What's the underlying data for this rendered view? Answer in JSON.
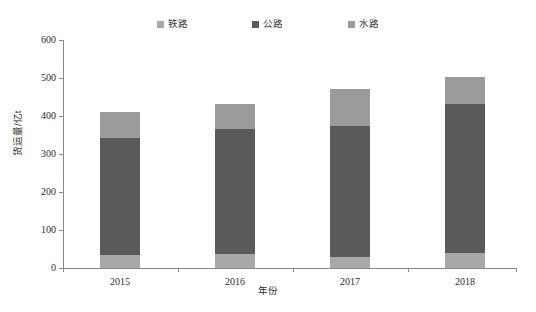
{
  "chart_data": {
    "type": "bar",
    "subtype": "stacked-vertical",
    "title": "",
    "xlabel": "年份",
    "ylabel": "货运量/亿t",
    "categories": [
      "2015",
      "2016",
      "2017",
      "2018"
    ],
    "series": [
      {
        "name": "铁路",
        "color": "#a8a8a8",
        "values": [
          33,
          37,
          29,
          39
        ]
      },
      {
        "name": "公路",
        "color": "#5a5a5a",
        "values": [
          310,
          330,
          345,
          392
        ]
      },
      {
        "name": "水路",
        "color": "#9b9b9b",
        "values": [
          67,
          65,
          97,
          72
        ]
      }
    ],
    "totals": [
      410,
      432,
      471,
      503
    ],
    "ylim": [
      0,
      600
    ],
    "yticks": [
      0,
      100,
      200,
      300,
      400,
      500,
      600
    ],
    "ytick_labels": [
      "0",
      "100",
      "200",
      "300",
      "400",
      "500",
      "600"
    ],
    "grid": false,
    "legend_position": "top-center",
    "stack_order_bottom_to_top": [
      "铁路",
      "公路",
      "水路"
    ]
  },
  "legend": {
    "items": [
      {
        "label": "铁路",
        "icon": "square-swatch-icon",
        "color": "#a8a8a8"
      },
      {
        "label": "公路",
        "icon": "square-swatch-icon",
        "color": "#5a5a5a"
      },
      {
        "label": "水路",
        "icon": "square-swatch-icon",
        "color": "#9b9b9b"
      }
    ]
  },
  "axes": {
    "y": {
      "title": "货运量/亿t",
      "ticks": [
        "600",
        "500",
        "400",
        "300",
        "200",
        "100",
        "0"
      ]
    },
    "x": {
      "title": "年份",
      "ticks": [
        "2015",
        "2016",
        "2017",
        "2018"
      ]
    }
  },
  "caption": {
    "text": ""
  }
}
